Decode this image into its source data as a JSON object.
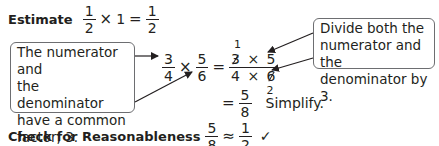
{
  "estimate": {
    "label": "Estimate",
    "a_num": "1",
    "a_den": "2",
    "times": "×",
    "one": "1",
    "equals": "=",
    "b_num": "1",
    "b_den": "2"
  },
  "left_callout": {
    "lines": [
      "The numerator and",
      "the denominator",
      "have a common",
      "factor, 3."
    ]
  },
  "right_callout": {
    "lines": [
      "Divide both the",
      "numerator and the",
      "denominator by 3."
    ]
  },
  "equation": {
    "f1_num": "3",
    "f1_den": "4",
    "times": "×",
    "f2_num": "5",
    "f2_den": "6",
    "equals": "=",
    "cancel_top": "1",
    "num_a": "3",
    "num_op": "×",
    "num_b": "5",
    "den_a": "4",
    "den_op": "×",
    "den_b": "6",
    "cancel_bottom": "2"
  },
  "result": {
    "equals": "=",
    "num": "5",
    "den": "8",
    "note": "Simplify."
  },
  "check": {
    "label": "Check for Reasonableness",
    "a_num": "5",
    "a_den": "8",
    "approx": "≈",
    "b_num": "1",
    "b_den": "2",
    "checkmark": "✓"
  },
  "colors": {
    "text": "#231f20",
    "box_border": "#6d6e71"
  }
}
